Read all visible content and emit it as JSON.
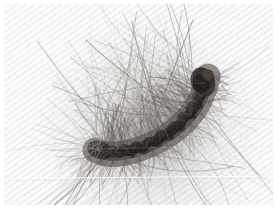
{
  "image": {
    "domain": "Natural-Image",
    "subject": "hairy caterpillar",
    "alt_text": "Close-up photograph of a dark hairy caterpillar curled on a pale striped fabric surface",
    "caption": "",
    "width": 278,
    "height": 210,
    "orientation": "landscape",
    "border": {
      "color": "#ffffff",
      "top": 4,
      "bottom": 5,
      "left": 4,
      "right": 5
    }
  },
  "palette": {
    "paper_white": "#ffffff",
    "background_light": "#f4f4f4",
    "background_mid": "#e6e6e6",
    "background_shadow": "#d8d8d6",
    "stripe_light": "#fafafa",
    "stripe_dark": "#e2e2e0",
    "hair_light": "#b9b6b2",
    "hair_mid": "#8a8682",
    "hair_dark": "#5c5752",
    "body_dark": "#241f1c",
    "body_black": "#120f0d",
    "body_brown": "#4a3a2e",
    "body_highlight": "#6d5b4a",
    "tuft_grey": "#7a7470",
    "seam_line": "#fdfdfd"
  },
  "scene": {
    "background": {
      "name": "striped fabric",
      "stripe_angle_deg": 35,
      "stripe_period_px": 5,
      "seam_line_y": 177,
      "vignette": "soft grey shadow under subject"
    },
    "subject": {
      "name": "caterpillar",
      "pose": "crescent curve, head raised at right",
      "body_path": "M 95 150 C 110 160, 150 152, 178 128 C 196 112, 205 92, 208 76",
      "body_thickness_px": 13,
      "head_center": {
        "x": 205,
        "y": 80
      },
      "tail_center": {
        "x": 97,
        "y": 148
      },
      "segment_count": 12,
      "hair_count": 150,
      "hair_fan_origin": {
        "x": 150,
        "y": 138
      },
      "hair_length_range_px": [
        40,
        150
      ]
    }
  },
  "annotations": {
    "visible_text": [],
    "labels": []
  }
}
